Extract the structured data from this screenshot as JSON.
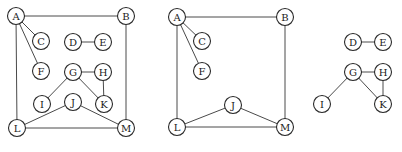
{
  "figure": {
    "graphs": [
      {
        "id": "full-graph",
        "nodes": [
          "A",
          "B",
          "C",
          "D",
          "E",
          "F",
          "G",
          "H",
          "I",
          "J",
          "K",
          "L",
          "M"
        ],
        "edges": [
          [
            "A",
            "B"
          ],
          [
            "A",
            "C"
          ],
          [
            "A",
            "F"
          ],
          [
            "A",
            "L"
          ],
          [
            "B",
            "M"
          ],
          [
            "D",
            "E"
          ],
          [
            "G",
            "H"
          ],
          [
            "G",
            "I"
          ],
          [
            "G",
            "K"
          ],
          [
            "H",
            "K"
          ],
          [
            "J",
            "L"
          ],
          [
            "J",
            "M"
          ],
          [
            "L",
            "M"
          ]
        ]
      },
      {
        "id": "component-1",
        "nodes": [
          "A",
          "B",
          "C",
          "F",
          "J",
          "L",
          "M"
        ],
        "edges": [
          [
            "A",
            "B"
          ],
          [
            "A",
            "C"
          ],
          [
            "A",
            "F"
          ],
          [
            "A",
            "L"
          ],
          [
            "B",
            "M"
          ],
          [
            "J",
            "L"
          ],
          [
            "J",
            "M"
          ],
          [
            "L",
            "M"
          ]
        ]
      },
      {
        "id": "component-2",
        "nodes": [
          "D",
          "E",
          "G",
          "H",
          "I",
          "K"
        ],
        "edges": [
          [
            "D",
            "E"
          ],
          [
            "G",
            "H"
          ],
          [
            "G",
            "I"
          ],
          [
            "G",
            "K"
          ],
          [
            "H",
            "K"
          ]
        ]
      }
    ]
  }
}
